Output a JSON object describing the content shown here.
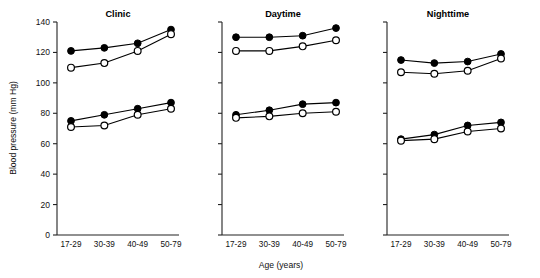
{
  "figure": {
    "xlabel": "Age (years)",
    "ylabel": "Blood pressure (mm Hg)"
  },
  "chart_data": {
    "type": "line",
    "title": "",
    "xlabel": "Age (years)",
    "ylabel": "Blood pressure (mm Hg)",
    "categories": [
      "17-29",
      "30-39",
      "40-49",
      "50-79"
    ],
    "ylim": [
      0,
      140
    ],
    "yticks": [
      0,
      20,
      40,
      60,
      80,
      100,
      120,
      140
    ],
    "ytick_labels": [
      "0",
      "20",
      "40",
      "60",
      "80",
      "100",
      "120",
      "140"
    ],
    "grid": false,
    "legend": "none",
    "panels": [
      {
        "title": "Clinic",
        "y_axis_labeled": true,
        "series": [
          {
            "name": "Systolic - filled circle",
            "marker": "filled-circle",
            "values": [
              121,
              123,
              126,
              135
            ]
          },
          {
            "name": "Systolic - open circle",
            "marker": "open-circle",
            "values": [
              110,
              113,
              121,
              132
            ]
          },
          {
            "name": "Diastolic - filled circle",
            "marker": "filled-circle",
            "values": [
              75,
              79,
              83,
              87
            ]
          },
          {
            "name": "Diastolic - open circle",
            "marker": "open-circle",
            "values": [
              71,
              72,
              79,
              83
            ]
          }
        ]
      },
      {
        "title": "Daytime",
        "y_axis_labeled": false,
        "series": [
          {
            "name": "Systolic - filled circle",
            "marker": "filled-circle",
            "values": [
              130,
              130,
              131,
              136
            ]
          },
          {
            "name": "Systolic - open circle",
            "marker": "open-circle",
            "values": [
              121,
              121,
              124,
              128
            ]
          },
          {
            "name": "Diastolic - filled circle",
            "marker": "filled-circle",
            "values": [
              79,
              82,
              86,
              87
            ]
          },
          {
            "name": "Diastolic - open circle",
            "marker": "open-circle",
            "values": [
              77,
              78,
              80,
              81
            ]
          }
        ]
      },
      {
        "title": "Nighttime",
        "y_axis_labeled": false,
        "series": [
          {
            "name": "Systolic - filled circle",
            "marker": "filled-circle",
            "values": [
              115,
              113,
              114,
              119
            ]
          },
          {
            "name": "Systolic - open circle",
            "marker": "open-circle",
            "values": [
              107,
              106,
              108,
              116
            ]
          },
          {
            "name": "Diastolic - filled circle",
            "marker": "filled-circle",
            "values": [
              63,
              66,
              72,
              74
            ]
          },
          {
            "name": "Diastolic - open circle",
            "marker": "open-circle",
            "values": [
              62,
              63,
              68,
              70
            ]
          }
        ]
      }
    ]
  }
}
